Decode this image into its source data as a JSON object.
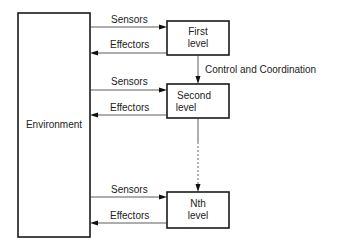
{
  "diagram": {
    "type": "hierarchical-control-block-diagram",
    "environment": {
      "label": "Environment"
    },
    "levels": [
      {
        "line1": "First",
        "line2": "level",
        "sensors_label": "Sensors",
        "effectors_label": "Effectors"
      },
      {
        "line1": "Second",
        "line2": "level",
        "sensors_label": "Sensors",
        "effectors_label": "Effectors"
      },
      {
        "line1": "Nth",
        "line2": "level",
        "sensors_label": "Sensors",
        "effectors_label": "Effectors"
      }
    ],
    "control_label": "Control and Coordination",
    "colors": {
      "stroke": "#1a1a1a",
      "text": "#222222",
      "background": "#ffffff"
    }
  }
}
